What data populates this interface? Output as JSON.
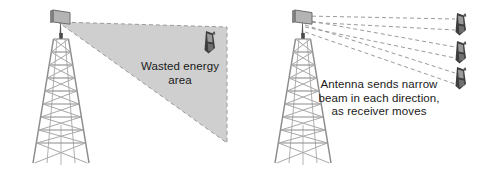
{
  "figure": {
    "background_color": "#ffffff",
    "ink_color": "#8c8c8c",
    "text_color": "#1a1a1a",
    "wedge_fill": "#cfcfcf",
    "dash_color": "#9a9a9a"
  },
  "left_panel": {
    "name": "wide-beam-wasted-energy",
    "caption": "Wasted energy\narea",
    "tower_label": "lattice-tower",
    "antenna_label": "panel-antenna",
    "receiver_count": 1
  },
  "right_panel": {
    "name": "narrow-beam-steering",
    "caption": "Antenna sends narrow\nbeam in each direction,\nas receiver moves",
    "tower_label": "lattice-tower",
    "antenna_label": "panel-antenna",
    "receiver_count": 3
  }
}
